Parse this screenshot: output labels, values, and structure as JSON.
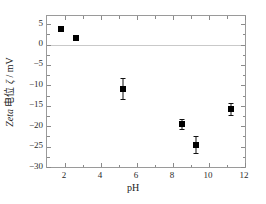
{
  "chart_data": {
    "type": "scatter",
    "title": "",
    "xlabel": "pH",
    "ylabel": "Zeta 电位 ζ / mV",
    "ylabel_parts": {
      "latin": "Zeta",
      "chinese": "电位",
      "symbol": "ζ",
      "separator": "/",
      "unit": "mV"
    },
    "xlim": [
      1.0,
      12.0
    ],
    "ylim": [
      -30.0,
      7.0
    ],
    "xticks": [
      2,
      4,
      6,
      8,
      10,
      12
    ],
    "xtick_labels": [
      "2",
      "4",
      "6",
      "8",
      "10",
      "12"
    ],
    "xticks_minor": [
      1,
      3,
      5,
      7,
      9,
      11
    ],
    "yticks": [
      5,
      0,
      -5,
      -10,
      -15,
      -20,
      -25,
      -30
    ],
    "ytick_labels": [
      "5",
      "0",
      "−5",
      "−10",
      "−15",
      "−20",
      "−25",
      "−30"
    ],
    "yticks_minor": [
      2.5,
      -2.5,
      -7.5,
      -12.5,
      -17.5,
      -22.5,
      -27.5
    ],
    "grid": false,
    "legend": null,
    "zero_line": {
      "value": 0,
      "color": "#c9c9c9"
    },
    "marker": {
      "shape": "square",
      "color": "#000000",
      "size_px": 6
    },
    "series": [
      {
        "name": "Zeta potential",
        "x": [
          1.8,
          2.6,
          5.2,
          8.5,
          9.3,
          11.2
        ],
        "y": [
          3.7,
          1.5,
          -10.8,
          -19.5,
          -24.5,
          -15.8
        ],
        "yerr": [
          0.0,
          0.0,
          2.6,
          1.3,
          2.1,
          1.5
        ]
      }
    ]
  },
  "axis_colors": {
    "frame": "#9a9a9a",
    "tick": "#8a8a8a",
    "text": "#1a1a1a",
    "zero_line": "#c9c9c9",
    "background": "#ffffff"
  }
}
